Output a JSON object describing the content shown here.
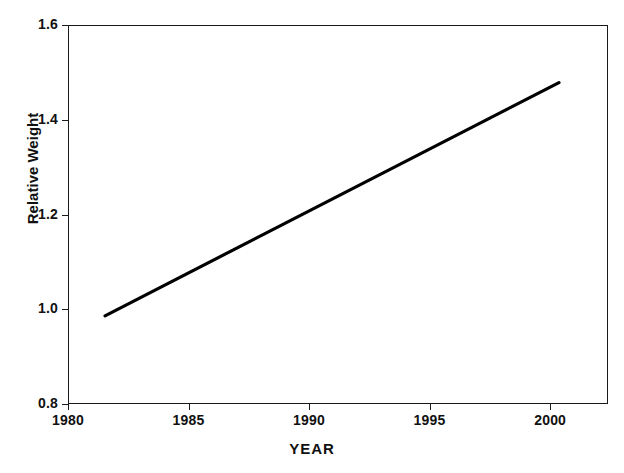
{
  "chart_data": {
    "type": "line",
    "title": "",
    "xlabel": "YEAR",
    "ylabel": "Relative Weight",
    "xlim": [
      1980,
      2002.4
    ],
    "ylim": [
      0.8,
      1.6
    ],
    "xticks": [
      1980,
      1985,
      1990,
      1995,
      2000
    ],
    "xtick_labels": [
      "1980",
      "1985",
      "1990",
      "1995",
      "2000"
    ],
    "yticks": [
      0.8,
      1.0,
      1.2,
      1.4,
      1.6
    ],
    "ytick_labels": [
      "0.8",
      "1.0",
      "1.2",
      "1.4",
      "1.6"
    ],
    "grid": false,
    "legend": false,
    "series": [
      {
        "name": "Relative Weight",
        "color": "#000000",
        "line_width": 3.2,
        "x": [
          1981.5,
          2000.4
        ],
        "values": [
          0.985,
          1.48
        ]
      }
    ]
  }
}
